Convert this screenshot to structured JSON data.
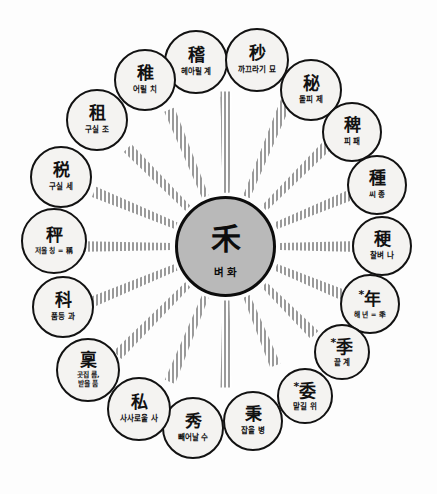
{
  "diagram": {
    "title": "",
    "type": "radial-hub-and-spoke",
    "center": {
      "han": "禾",
      "ko": "벼 화",
      "fill": "#b9b9b9",
      "stroke": "#0c0c0c"
    },
    "node_style": {
      "fill": "#f4f3f1",
      "stroke": "#121212",
      "spoke_color": "#9a9a9a"
    },
    "nodes": [
      {
        "id": "node-gye",
        "han": "稽",
        "ko": "헤아릴 계",
        "marked": false,
        "angle": -90,
        "cx": 196,
        "cy": 62,
        "r": 32
      },
      {
        "id": "node-myo",
        "han": "秒",
        "ko": "까끄라기 묘",
        "marked": false,
        "angle": -67.5,
        "cx": 257,
        "cy": 60,
        "r": 32
      },
      {
        "id": "node-je",
        "han": "秘",
        "ko": "돌피 제",
        "marked": false,
        "angle": -45,
        "cx": 311,
        "cy": 90,
        "r": 31
      },
      {
        "id": "node-pae",
        "han": "稗",
        "ko": "피 패",
        "marked": false,
        "angle": -22.5,
        "cx": 352,
        "cy": 132,
        "r": 30
      },
      {
        "id": "node-jong",
        "han": "種",
        "ko": "씨 종",
        "marked": false,
        "angle": 0,
        "cx": 377,
        "cy": 185,
        "r": 30
      },
      {
        "id": "node-na",
        "han": "稉",
        "ko": "찰벼 나",
        "marked": false,
        "angle": 22.5,
        "cx": 382,
        "cy": 246,
        "r": 30
      },
      {
        "id": "node-nyeon",
        "han": "年",
        "ko": "해 년 = 秊",
        "marked": true,
        "angle": 45,
        "cx": 370,
        "cy": 304,
        "r": 30
      },
      {
        "id": "node-gye2",
        "han": "季",
        "ko": "끝 계",
        "marked": true,
        "angle": 67.5,
        "cx": 342,
        "cy": 352,
        "r": 28
      },
      {
        "id": "node-wi",
        "han": "委",
        "ko": "맡길 위",
        "marked": true,
        "angle": 90,
        "cx": 305,
        "cy": 396,
        "r": 28
      },
      {
        "id": "node-byeong",
        "han": "秉",
        "ko": "잡을 병",
        "marked": false,
        "angle": 112.5,
        "cx": 253,
        "cy": 421,
        "r": 30
      },
      {
        "id": "node-su",
        "han": "秀",
        "ko": "빼어날 수",
        "marked": false,
        "angle": 135,
        "cx": 193,
        "cy": 428,
        "r": 31
      },
      {
        "id": "node-sa",
        "han": "私",
        "ko": "사사로울 사",
        "marked": false,
        "angle": 157.5,
        "cx": 139,
        "cy": 409,
        "r": 32
      },
      {
        "id": "node-reum",
        "han": "稟",
        "ko": "곳집 름,\n받을 품",
        "marked": false,
        "angle": 180,
        "cx": 88,
        "cy": 370,
        "r": 32
      },
      {
        "id": "node-gwa",
        "han": "科",
        "ko": "품등 과",
        "marked": false,
        "angle": 202.5,
        "cx": 63,
        "cy": 307,
        "r": 31
      },
      {
        "id": "node-ching",
        "han": "秤",
        "ko": "저울 칭 = 稱",
        "marked": false,
        "angle": 225,
        "cx": 54,
        "cy": 241,
        "r": 33
      },
      {
        "id": "node-se",
        "han": "税",
        "ko": "구실 세",
        "marked": false,
        "angle": 247.5,
        "cx": 61,
        "cy": 177,
        "r": 31
      },
      {
        "id": "node-jo",
        "han": "租",
        "ko": "구실 조",
        "marked": false,
        "angle": 270,
        "cx": 97,
        "cy": 120,
        "r": 31
      },
      {
        "id": "node-chi",
        "han": "稚",
        "ko": "어릴 치",
        "marked": false,
        "angle": 292.5,
        "cx": 145,
        "cy": 80,
        "r": 31
      }
    ],
    "marker_symbol": "*"
  }
}
